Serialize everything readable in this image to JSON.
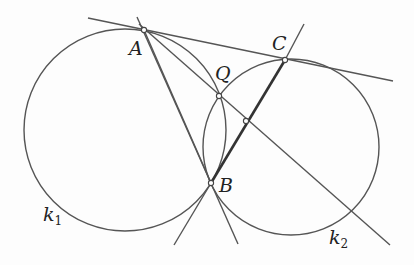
{
  "diagram": {
    "type": "geometry",
    "stroke_color": "#555555",
    "thick_stroke_color": "#333333",
    "points": [
      {
        "id": "A",
        "label": "A",
        "x": 144,
        "y": 30
      },
      {
        "id": "B",
        "label": "B",
        "x": 211,
        "y": 183
      },
      {
        "id": "C",
        "label": "C",
        "x": 285,
        "y": 60
      },
      {
        "id": "Q",
        "label": "Q",
        "x": 219,
        "y": 96
      },
      {
        "id": "M",
        "label": "",
        "x": 246,
        "y": 121
      }
    ],
    "circles": [
      {
        "id": "k1",
        "label": "k",
        "subscript": "1",
        "cx": 125,
        "cy": 130,
        "r": 101
      },
      {
        "id": "k2",
        "label": "k",
        "subscript": "2",
        "cx": 291,
        "cy": 147,
        "r": 88
      }
    ],
    "segments": [
      {
        "from": "tangent-left",
        "to": "tangent-right",
        "x1": 88,
        "y1": 18,
        "x2": 393,
        "y2": 81
      },
      {
        "from": "A",
        "to": "lower-B-right",
        "x1": 140,
        "y1": 22,
        "x2": 238,
        "y2": 244
      },
      {
        "from": "A",
        "to": "lower-right",
        "x1": 144,
        "y1": 30,
        "x2": 390,
        "y2": 245
      },
      {
        "from": "B-left",
        "to": "C-top",
        "x1": 174,
        "y1": 245,
        "x2": 307,
        "y2": 23,
        "thick_from": "B",
        "thick_to": "C"
      },
      {
        "from": "A",
        "to": "Q-curve",
        "x1": 133,
        "y1": 20,
        "x2": 146,
        "y2": 34
      }
    ]
  }
}
